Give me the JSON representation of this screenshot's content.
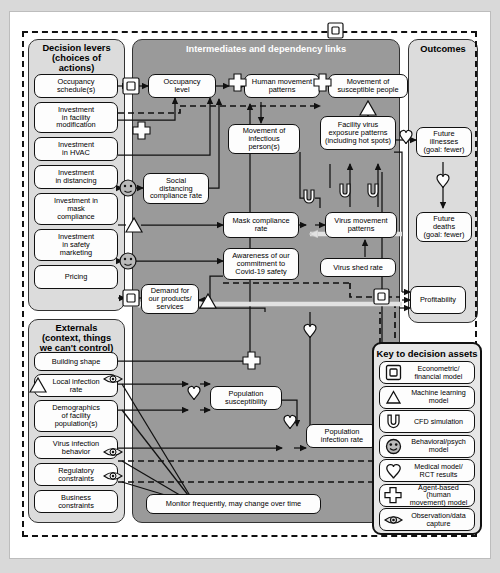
{
  "diagram": {
    "panels": {
      "decision_levers": {
        "title": "Decision levers\n(choices of\nactions)"
      },
      "intermediates": {
        "title": "Intermediates and dependency links"
      },
      "outcomes": {
        "title": "Outcomes"
      },
      "externals": {
        "title": "Externals\n(context, things\nwe can't control)"
      },
      "legend": {
        "title": "Key to decision assets"
      }
    },
    "decision_levers": [
      {
        "label": "Occupancy\nschedule(s)",
        "asset": "econometric"
      },
      {
        "label": "Investment\nin facility\nmodification",
        "asset": "none"
      },
      {
        "label": "Investment\nin HVAC",
        "asset": "none"
      },
      {
        "label": "Investment\nin distancing",
        "asset": "behavioral"
      },
      {
        "label": "Investment in\nmask\ncompliance",
        "asset": "ml"
      },
      {
        "label": "Investment\nin safety\nmarketing",
        "asset": "behavioral"
      },
      {
        "label": "Pricing",
        "asset": "econometric"
      }
    ],
    "externals": [
      {
        "label": "Building shape",
        "asset": "none"
      },
      {
        "label": "Local infection\nrate",
        "asset": "observation"
      },
      {
        "label": "Demographics\nof facility\npopulation(s)",
        "asset": "none"
      },
      {
        "label": "Virus infection\nbehavior",
        "asset": "observation"
      },
      {
        "label": "Regulatory\nconstraints",
        "asset": "observation"
      },
      {
        "label": "Business\nconstraints",
        "asset": "none"
      }
    ],
    "intermediates": [
      {
        "label": "Occupancy\nlevel"
      },
      {
        "label": "Human movement\npatterns"
      },
      {
        "label": "Movement of\nsusceptible people"
      },
      {
        "label": "Movement of\ninfectious\nperson(s)"
      },
      {
        "label": "Facility virus\nexposure patterns\n(including hot spots)"
      },
      {
        "label": "Social\ndistancing\ncompliance rate"
      },
      {
        "label": "Mask compliance\nrate"
      },
      {
        "label": "Virus movement\npatterns"
      },
      {
        "label": "Awareness of our\ncommitment to\nCovid-19 safety"
      },
      {
        "label": "Virus shed rate"
      },
      {
        "label": "Demand for\nour products/\nservices"
      },
      {
        "label": "Population\nsusceptibility"
      },
      {
        "label": "Population\ninfection rate"
      }
    ],
    "outcomes": [
      {
        "label": "Future\nillnesses\n(goal: fewer)"
      },
      {
        "label": "Future\ndeaths\n(goal: fewer)"
      },
      {
        "label": "Profitability"
      }
    ],
    "note": "Monitor frequently, may change over time",
    "legend_items": [
      {
        "icon": "econometric-icon",
        "label": "Econometric/\nfinancial model"
      },
      {
        "icon": "machine-learning-icon",
        "label": "Machine learning\nmodel"
      },
      {
        "icon": "cfd-icon",
        "label": "CFD simulation"
      },
      {
        "icon": "behavioral-icon",
        "label": "Behavioral/psych\nmodel"
      },
      {
        "icon": "medical-icon",
        "label": "Medical model/\nRCT results"
      },
      {
        "icon": "agent-based-icon",
        "label": "Agent-based (human\nmovement) model"
      },
      {
        "icon": "observation-icon",
        "label": "Observation/data\ncapture"
      }
    ],
    "colors": {
      "panel_light": "#dcdcdc",
      "panel_dark": "#9a9a9a",
      "box_fill": "#fdfdfd",
      "stroke": "#111111",
      "page_bg": "#d9d9d9",
      "canvas_bg": "#ffffff"
    }
  }
}
